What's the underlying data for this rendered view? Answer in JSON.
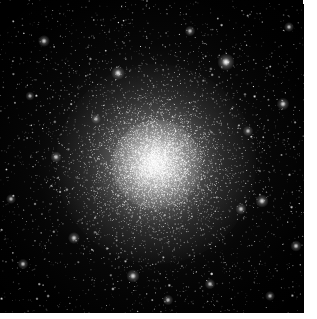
{
  "image": {
    "kind": "astronomical-photograph",
    "subject": "globular star cluster",
    "description": "Dense spherical swarm of tens of thousands of stars with an unresolved bright core fading into a sparse outer halo against a black night sky.",
    "alt_text": "Globular cluster: bright white core of blended starlight surrounded by thousands of individually resolved pinpoint stars on black background",
    "canvas": {
      "width": 317,
      "height": 319
    },
    "frame": {
      "x": 0,
      "y": 0,
      "width": 304,
      "height": 313
    },
    "page_background": "#ffffff",
    "sky_background": "#000000",
    "star_color": "#ffffff"
  },
  "cluster": {
    "center": {
      "x": 156,
      "y": 164
    },
    "core_radius_px": 28,
    "half_light_radius_px": 62,
    "halo_radius_px": 150,
    "core_peak_color": "#f2f2f2",
    "halo_color": "#9a9a9a",
    "star_counts": {
      "core": 4200,
      "inner_halo": 3400,
      "outer_field": 2600,
      "bright_foreground": 140,
      "total": 10340
    }
  },
  "bright_stars": [
    {
      "x": 226,
      "y": 62,
      "radius": 2.6,
      "brightness": 1.0
    },
    {
      "x": 118,
      "y": 73,
      "radius": 2.1,
      "brightness": 0.92
    },
    {
      "x": 44,
      "y": 41,
      "radius": 1.8,
      "brightness": 0.86
    },
    {
      "x": 283,
      "y": 104,
      "radius": 1.9,
      "brightness": 0.88
    },
    {
      "x": 262,
      "y": 201,
      "radius": 2.0,
      "brightness": 0.9
    },
    {
      "x": 241,
      "y": 209,
      "radius": 1.7,
      "brightness": 0.84
    },
    {
      "x": 74,
      "y": 238,
      "radius": 1.8,
      "brightness": 0.85
    },
    {
      "x": 133,
      "y": 276,
      "radius": 2.0,
      "brightness": 0.89
    },
    {
      "x": 23,
      "y": 264,
      "radius": 1.6,
      "brightness": 0.82
    },
    {
      "x": 296,
      "y": 246,
      "radius": 1.7,
      "brightness": 0.83
    },
    {
      "x": 190,
      "y": 31,
      "radius": 1.6,
      "brightness": 0.81
    },
    {
      "x": 56,
      "y": 157,
      "radius": 1.7,
      "brightness": 0.84
    },
    {
      "x": 210,
      "y": 284,
      "radius": 1.6,
      "brightness": 0.8
    },
    {
      "x": 289,
      "y": 27,
      "radius": 1.5,
      "brightness": 0.78
    },
    {
      "x": 11,
      "y": 199,
      "radius": 1.5,
      "brightness": 0.77
    },
    {
      "x": 168,
      "y": 300,
      "radius": 1.6,
      "brightness": 0.79
    },
    {
      "x": 248,
      "y": 131,
      "radius": 1.6,
      "brightness": 0.8
    },
    {
      "x": 96,
      "y": 119,
      "radius": 1.5,
      "brightness": 0.76
    },
    {
      "x": 270,
      "y": 296,
      "radius": 1.5,
      "brightness": 0.75
    },
    {
      "x": 30,
      "y": 96,
      "radius": 1.4,
      "brightness": 0.74
    }
  ],
  "render": {
    "seed": 20240517,
    "density_falloff": "r^-1.9 plummer-like",
    "gutters": {
      "right_px": 13,
      "bottom_px": 6
    }
  }
}
